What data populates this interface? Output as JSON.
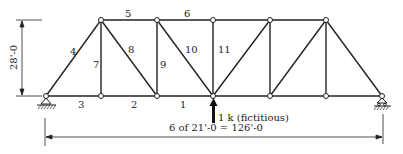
{
  "diagram": {
    "type": "truss",
    "height_label": "28'-0",
    "span_label": "6 of 21'-0 = 126'-0",
    "load_label": "1 k (fictitious)",
    "member_labels": [
      {
        "id": "1",
        "x": 180,
        "y": 100
      },
      {
        "id": "2",
        "x": 130,
        "y": 100
      },
      {
        "id": "3",
        "x": 77,
        "y": 100
      },
      {
        "id": "4",
        "x": 68,
        "y": 48
      },
      {
        "id": "5",
        "x": 124,
        "y": 10
      },
      {
        "id": "6",
        "x": 183,
        "y": 10
      },
      {
        "id": "7",
        "x": 92,
        "y": 61
      },
      {
        "id": "8",
        "x": 127,
        "y": 46
      },
      {
        "id": "9",
        "x": 159,
        "y": 61
      },
      {
        "id": "10",
        "x": 185,
        "y": 46
      },
      {
        "id": "11",
        "x": 217,
        "y": 45
      }
    ],
    "nodes_bottom_x": [
      46,
      101,
      157,
      213,
      270,
      326,
      382
    ],
    "nodes_top_x": [
      101,
      157,
      213,
      270,
      326
    ],
    "chord_y": {
      "top": 20,
      "bottom": 96
    }
  }
}
